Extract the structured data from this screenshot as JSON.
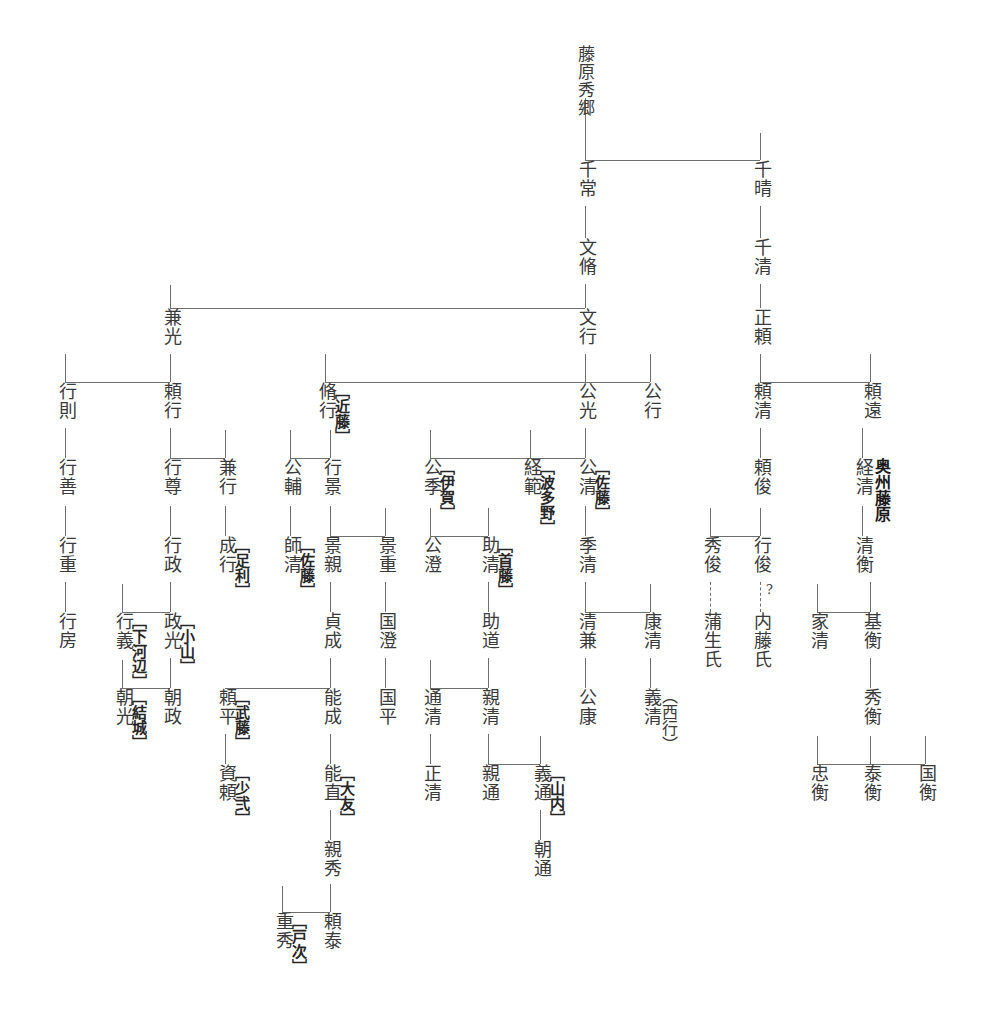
{
  "root": {
    "name": "藤原秀郷"
  },
  "persons": [
    {
      "id": "hidesato",
      "name": "藤原秀郷",
      "tag": "",
      "x": 585,
      "y": 45
    },
    {
      "id": "tsunetsune",
      "name": "千常",
      "tag": "",
      "x": 585,
      "y": 160
    },
    {
      "id": "fumiyoshi",
      "name": "文脩",
      "tag": "",
      "x": 585,
      "y": 238
    },
    {
      "id": "fumiyuki",
      "name": "文行",
      "tag": "",
      "x": 585,
      "y": 308
    },
    {
      "id": "chiharu",
      "name": "千晴",
      "tag": "",
      "x": 760,
      "y": 160
    },
    {
      "id": "chikiyo",
      "name": "千清",
      "tag": "",
      "x": 760,
      "y": 238
    },
    {
      "id": "masayori",
      "name": "正頼",
      "tag": "",
      "x": 760,
      "y": 308
    },
    {
      "id": "kanemitsu",
      "name": "兼光",
      "tag": "",
      "x": 170,
      "y": 308
    },
    {
      "id": "yukinori",
      "name": "行則",
      "tag": "",
      "x": 65,
      "y": 382
    },
    {
      "id": "yoriyuki",
      "name": "頼行",
      "tag": "",
      "x": 170,
      "y": 382
    },
    {
      "id": "nagayuki",
      "name": "脩行",
      "tag": "近藤",
      "x": 325,
      "y": 382
    },
    {
      "id": "kimimitsu",
      "name": "公光",
      "tag": "",
      "x": 585,
      "y": 382
    },
    {
      "id": "kimiyuki",
      "name": "公行",
      "tag": "",
      "x": 650,
      "y": 382
    },
    {
      "id": "yorikiyo",
      "name": "頼清",
      "tag": "",
      "x": 760,
      "y": 382
    },
    {
      "id": "yoritoh",
      "name": "頼遠",
      "tag": "",
      "x": 870,
      "y": 382
    },
    {
      "id": "yukiyoshi",
      "name": "行善",
      "tag": "",
      "x": 65,
      "y": 458
    },
    {
      "id": "yukitaka",
      "name": "行尊",
      "tag": "",
      "x": 170,
      "y": 458
    },
    {
      "id": "kaneyuki",
      "name": "兼行",
      "tag": "",
      "x": 225,
      "y": 458
    },
    {
      "id": "kinsuke",
      "name": "公輔",
      "tag": "",
      "x": 290,
      "y": 458
    },
    {
      "id": "yukikage",
      "name": "行景",
      "tag": "",
      "x": 330,
      "y": 458
    },
    {
      "id": "kimisue",
      "name": "公季",
      "tag": "伊賀",
      "x": 430,
      "y": 458
    },
    {
      "id": "tsunenori",
      "name": "経範",
      "tag": "波多野",
      "x": 530,
      "y": 458
    },
    {
      "id": "kimikiyo",
      "name": "公清",
      "tag": "佐藤",
      "x": 585,
      "y": 458
    },
    {
      "id": "yoritoshi",
      "name": "頼俊",
      "tag": "",
      "x": 760,
      "y": 458
    },
    {
      "id": "tsunekiyo",
      "name": "経清",
      "tag": "",
      "x": 862,
      "y": 458,
      "side_label": "奥州藤原"
    },
    {
      "id": "yukishige",
      "name": "行重",
      "tag": "",
      "x": 65,
      "y": 536
    },
    {
      "id": "yukimasa",
      "name": "行政",
      "tag": "",
      "x": 170,
      "y": 536
    },
    {
      "id": "nariyuki",
      "name": "成行",
      "tag": "足利",
      "x": 225,
      "y": 536
    },
    {
      "id": "morokiyo",
      "name": "師清",
      "tag": "佐藤",
      "x": 290,
      "y": 536
    },
    {
      "id": "kagechika",
      "name": "景親",
      "tag": "",
      "x": 330,
      "y": 536
    },
    {
      "id": "kageshige",
      "name": "景重",
      "tag": "",
      "x": 385,
      "y": 536
    },
    {
      "id": "kimizumi",
      "name": "公澄",
      "tag": "",
      "x": 430,
      "y": 536
    },
    {
      "id": "sukekiyo",
      "name": "助清",
      "tag": "首藤",
      "x": 488,
      "y": 536
    },
    {
      "id": "suekiyo",
      "name": "季清",
      "tag": "",
      "x": 585,
      "y": 536
    },
    {
      "id": "hidetoshi",
      "name": "秀俊",
      "tag": "",
      "x": 710,
      "y": 536
    },
    {
      "id": "yukitoshi",
      "name": "行俊",
      "tag": "",
      "x": 760,
      "y": 536
    },
    {
      "id": "kiyohira",
      "name": "清衡",
      "tag": "",
      "x": 862,
      "y": 536
    },
    {
      "id": "yukifusa",
      "name": "行房",
      "tag": "",
      "x": 65,
      "y": 612
    },
    {
      "id": "yukiyoshi2",
      "name": "行義",
      "tag": "下河辺",
      "x": 122,
      "y": 612
    },
    {
      "id": "masamitsu",
      "name": "政光",
      "tag": "小山",
      "x": 170,
      "y": 612
    },
    {
      "id": "sadanari",
      "name": "貞成",
      "tag": "",
      "x": 330,
      "y": 612
    },
    {
      "id": "kunizumi",
      "name": "国澄",
      "tag": "",
      "x": 385,
      "y": 612
    },
    {
      "id": "sukemichi",
      "name": "助道",
      "tag": "",
      "x": 488,
      "y": 612
    },
    {
      "id": "kiyokane",
      "name": "清兼",
      "tag": "",
      "x": 585,
      "y": 612
    },
    {
      "id": "yasukiyo",
      "name": "康清",
      "tag": "",
      "x": 650,
      "y": 612
    },
    {
      "id": "gamo",
      "name": "蒲生氏",
      "tag": "",
      "x": 710,
      "y": 612
    },
    {
      "id": "naito",
      "name": "内藤氏",
      "tag": "",
      "x": 760,
      "y": 612
    },
    {
      "id": "iekiyo",
      "name": "家清",
      "tag": "",
      "x": 817,
      "y": 612
    },
    {
      "id": "motohira",
      "name": "基衡",
      "tag": "",
      "x": 870,
      "y": 612
    },
    {
      "id": "tomomitsu",
      "name": "朝光",
      "tag": "結城",
      "x": 122,
      "y": 688
    },
    {
      "id": "tomomasa",
      "name": "朝政",
      "tag": "",
      "x": 170,
      "y": 688
    },
    {
      "id": "yorihira",
      "name": "頼平",
      "tag": "武藤",
      "x": 225,
      "y": 688
    },
    {
      "id": "yoshinari",
      "name": "能成",
      "tag": "",
      "x": 330,
      "y": 688
    },
    {
      "id": "kunihira",
      "name": "国平",
      "tag": "",
      "x": 385,
      "y": 688
    },
    {
      "id": "michikiyo",
      "name": "通清",
      "tag": "",
      "x": 430,
      "y": 688
    },
    {
      "id": "chikakiyo",
      "name": "親清",
      "tag": "",
      "x": 488,
      "y": 688
    },
    {
      "id": "kimiyasu",
      "name": "公康",
      "tag": "",
      "x": 585,
      "y": 688
    },
    {
      "id": "yoshikiyo",
      "name": "義清",
      "tag": "",
      "x": 650,
      "y": 688,
      "paren": "（西行）"
    },
    {
      "id": "hidehira",
      "name": "秀衡",
      "tag": "",
      "x": 870,
      "y": 688
    },
    {
      "id": "sukeyori",
      "name": "資頼",
      "tag": "少弐",
      "x": 225,
      "y": 764
    },
    {
      "id": "yoshinao",
      "name": "能直",
      "tag": "大友",
      "x": 330,
      "y": 764
    },
    {
      "id": "masakiyo",
      "name": "正清",
      "tag": "",
      "x": 430,
      "y": 764
    },
    {
      "id": "chikamichi",
      "name": "親通",
      "tag": "",
      "x": 488,
      "y": 764
    },
    {
      "id": "yoshimichi",
      "name": "義通",
      "tag": "山内",
      "x": 540,
      "y": 764
    },
    {
      "id": "tadahira",
      "name": "忠衡",
      "tag": "",
      "x": 817,
      "y": 764
    },
    {
      "id": "yasuhira",
      "name": "泰衡",
      "tag": "",
      "x": 870,
      "y": 764
    },
    {
      "id": "kunihira2",
      "name": "国衡",
      "tag": "",
      "x": 925,
      "y": 764
    },
    {
      "id": "chikahide",
      "name": "親秀",
      "tag": "",
      "x": 330,
      "y": 840
    },
    {
      "id": "tomomichi",
      "name": "朝通",
      "tag": "",
      "x": 540,
      "y": 840
    },
    {
      "id": "shigehide",
      "name": "重秀",
      "tag": "戸次",
      "x": 282,
      "y": 912
    },
    {
      "id": "yoriyasu",
      "name": "頼泰",
      "tag": "",
      "x": 330,
      "y": 912
    }
  ],
  "edges": {
    "vertical": [
      {
        "x": 585,
        "y": 98,
        "h": 62,
        "note": "hidesato-down"
      },
      {
        "x": 585,
        "y": 206,
        "h": 32,
        "note": "tsunetsune-fumiyoshi"
      },
      {
        "x": 585,
        "y": 284,
        "h": 24,
        "note": "fumiyoshi-fumiyuki"
      },
      {
        "x": 760,
        "y": 133,
        "h": 27,
        "note": "to-chiharu"
      },
      {
        "x": 760,
        "y": 206,
        "h": 32,
        "note": "chiharu-chikiyo"
      },
      {
        "x": 760,
        "y": 284,
        "h": 24,
        "note": "chikiyo-masayori"
      },
      {
        "x": 170,
        "y": 285,
        "h": 23,
        "note": "to-kanemitsu"
      },
      {
        "x": 170,
        "y": 354,
        "h": 28,
        "note": "kanemitsu-down"
      },
      {
        "x": 65,
        "y": 354,
        "h": 28,
        "note": "to-yukinori"
      },
      {
        "x": 325,
        "y": 354,
        "h": 28,
        "note": "to-nagayuki"
      },
      {
        "x": 585,
        "y": 354,
        "h": 28,
        "note": "to-kimimitsu"
      },
      {
        "x": 650,
        "y": 354,
        "h": 28,
        "note": "to-kimiyuki"
      },
      {
        "x": 760,
        "y": 354,
        "h": 28,
        "note": "to-yorikiyo"
      },
      {
        "x": 870,
        "y": 354,
        "h": 28,
        "note": "to-yoritoh"
      },
      {
        "x": 65,
        "y": 428,
        "h": 30,
        "note": "yukinori-yukiyoshi"
      },
      {
        "x": 170,
        "y": 428,
        "h": 30,
        "note": "yoriyuki-down"
      },
      {
        "x": 225,
        "y": 430,
        "h": 28,
        "note": "to-kaneyuki"
      },
      {
        "x": 290,
        "y": 430,
        "h": 28,
        "note": "to-kinsuke"
      },
      {
        "x": 330,
        "y": 430,
        "h": 28,
        "note": "to-yukikage"
      },
      {
        "x": 430,
        "y": 430,
        "h": 28,
        "note": "to-kimisue"
      },
      {
        "x": 530,
        "y": 430,
        "h": 28,
        "note": "to-tsunenori"
      },
      {
        "x": 585,
        "y": 428,
        "h": 30,
        "note": "kimimitsu-kimikiyo"
      },
      {
        "x": 760,
        "y": 428,
        "h": 30,
        "note": "yorikiyo-yoritoshi"
      },
      {
        "x": 862,
        "y": 428,
        "h": 30,
        "note": "yoritoh-tsunekiyo"
      },
      {
        "x": 65,
        "y": 506,
        "h": 30,
        "note": "yukiyoshi-yukishige"
      },
      {
        "x": 170,
        "y": 506,
        "h": 30,
        "note": "yukitaka-yukimasa"
      },
      {
        "x": 225,
        "y": 506,
        "h": 30,
        "note": "kaneyuki-nariyuki"
      },
      {
        "x": 290,
        "y": 506,
        "h": 30,
        "note": "kinsuke-morokiyo"
      },
      {
        "x": 330,
        "y": 506,
        "h": 30,
        "note": "yukikage-down"
      },
      {
        "x": 385,
        "y": 508,
        "h": 28,
        "note": "to-kageshige"
      },
      {
        "x": 430,
        "y": 508,
        "h": 28,
        "note": "to-kimizumi"
      },
      {
        "x": 488,
        "y": 508,
        "h": 28,
        "note": "to-sukekiyo"
      },
      {
        "x": 585,
        "y": 506,
        "h": 30,
        "note": "kimikiyo-suekiyo"
      },
      {
        "x": 862,
        "y": 506,
        "h": 30,
        "note": "tsunekiyo-kiyohira"
      },
      {
        "x": 710,
        "y": 508,
        "h": 28,
        "note": "to-hidetoshi"
      },
      {
        "x": 760,
        "y": 508,
        "h": 28,
        "note": "to-yukitoshi"
      },
      {
        "x": 65,
        "y": 582,
        "h": 30,
        "note": "yukishige-yukifusa"
      },
      {
        "x": 170,
        "y": 582,
        "h": 30,
        "note": "yukimasa-down"
      },
      {
        "x": 122,
        "y": 584,
        "h": 28,
        "note": "to-yukiyoshi2"
      },
      {
        "x": 330,
        "y": 582,
        "h": 30,
        "note": "kagechika-sadanari"
      },
      {
        "x": 385,
        "y": 582,
        "h": 30,
        "note": "kageshige-kunizumi"
      },
      {
        "x": 488,
        "y": 582,
        "h": 30,
        "note": "sukekiyo-sukemichi"
      },
      {
        "x": 585,
        "y": 582,
        "h": 30,
        "note": "suekiyo-down"
      },
      {
        "x": 650,
        "y": 584,
        "h": 28,
        "note": "to-yasukiyo"
      },
      {
        "x": 817,
        "y": 584,
        "h": 28,
        "note": "to-iekiyo"
      },
      {
        "x": 870,
        "y": 582,
        "h": 30,
        "note": "kiyohira-motohira"
      },
      {
        "x": 170,
        "y": 658,
        "h": 30,
        "note": "masamitsu-down"
      },
      {
        "x": 122,
        "y": 660,
        "h": 28,
        "note": "to-tomomitsu"
      },
      {
        "x": 330,
        "y": 658,
        "h": 30,
        "note": "sadanari-down"
      },
      {
        "x": 385,
        "y": 658,
        "h": 30,
        "note": "kunizumi-kunihira"
      },
      {
        "x": 430,
        "y": 660,
        "h": 28,
        "note": "to-michikiyo"
      },
      {
        "x": 488,
        "y": 658,
        "h": 30,
        "note": "sukemichi-chikakiyo"
      },
      {
        "x": 585,
        "y": 658,
        "h": 30,
        "note": "kiyokane-kimiyasu"
      },
      {
        "x": 650,
        "y": 658,
        "h": 30,
        "note": "yasukiyo-yoshikiyo"
      },
      {
        "x": 870,
        "y": 658,
        "h": 30,
        "note": "motohira-hidehira"
      },
      {
        "x": 225,
        "y": 734,
        "h": 30,
        "note": "yorihira-sukeyori"
      },
      {
        "x": 330,
        "y": 734,
        "h": 30,
        "note": "yoshinari-yoshinao"
      },
      {
        "x": 430,
        "y": 734,
        "h": 30,
        "note": "michikiyo-masakiyo"
      },
      {
        "x": 488,
        "y": 734,
        "h": 30,
        "note": "chikakiyo-down"
      },
      {
        "x": 540,
        "y": 736,
        "h": 28,
        "note": "to-yoshimichi"
      },
      {
        "x": 817,
        "y": 736,
        "h": 28,
        "note": "to-tadahira"
      },
      {
        "x": 870,
        "y": 736,
        "h": 28,
        "note": "to-yasuhira"
      },
      {
        "x": 925,
        "y": 736,
        "h": 28,
        "note": "to-kunihira2"
      },
      {
        "x": 330,
        "y": 810,
        "h": 30,
        "note": "yoshinao-chikahide"
      },
      {
        "x": 540,
        "y": 810,
        "h": 30,
        "note": "yoshimichi-tomomichi"
      },
      {
        "x": 330,
        "y": 884,
        "h": 28,
        "note": "chikahide-down"
      },
      {
        "x": 282,
        "y": 886,
        "h": 26,
        "note": "to-shigehide"
      }
    ],
    "horizontal": [
      {
        "x": 585,
        "y": 160,
        "w": 175,
        "note": "hidesato-children"
      },
      {
        "x": 170,
        "y": 308,
        "w": 415,
        "note": "fumiyoshi-children"
      },
      {
        "x": 65,
        "y": 382,
        "w": 105,
        "note": "kanemitsu-children"
      },
      {
        "x": 325,
        "y": 382,
        "w": 325,
        "note": "fumiyuki-children"
      },
      {
        "x": 760,
        "y": 382,
        "w": 110,
        "note": "masayori-children"
      },
      {
        "x": 170,
        "y": 458,
        "w": 55,
        "note": "yoriyuki-children"
      },
      {
        "x": 290,
        "y": 458,
        "w": 40,
        "note": "nagayuki-children"
      },
      {
        "x": 430,
        "y": 458,
        "w": 155,
        "note": "kimimitsu-children"
      },
      {
        "x": 330,
        "y": 536,
        "w": 55,
        "note": "yukikage-children"
      },
      {
        "x": 430,
        "y": 536,
        "w": 58,
        "note": "kimisue-children"
      },
      {
        "x": 710,
        "y": 536,
        "w": 50,
        "note": "yoritoshi-children"
      },
      {
        "x": 122,
        "y": 612,
        "w": 48,
        "note": "yukimasa-children"
      },
      {
        "x": 585,
        "y": 612,
        "w": 65,
        "note": "suekiyo-children"
      },
      {
        "x": 817,
        "y": 612,
        "w": 53,
        "note": "kiyohira-children"
      },
      {
        "x": 122,
        "y": 688,
        "w": 48,
        "note": "masamitsu-children"
      },
      {
        "x": 225,
        "y": 688,
        "w": 105,
        "note": "sadanari-children"
      },
      {
        "x": 430,
        "y": 688,
        "w": 58,
        "note": "sukemichi-children"
      },
      {
        "x": 488,
        "y": 764,
        "w": 52,
        "note": "chikakiyo-children"
      },
      {
        "x": 817,
        "y": 764,
        "w": 108,
        "note": "hidehira-children"
      },
      {
        "x": 282,
        "y": 912,
        "w": 48,
        "note": "chikahide-children"
      }
    ],
    "dashed_vertical": [
      {
        "x": 710,
        "y": 582,
        "h": 30,
        "note": "hidetoshi-gamo"
      },
      {
        "x": 760,
        "y": 582,
        "h": 30,
        "note": "yukitoshi-naito"
      }
    ]
  },
  "annotations": [
    {
      "id": "question-mark",
      "text": "?",
      "x": 766,
      "y": 582
    }
  ],
  "colors": {
    "line": "#6e6e6e",
    "text": "#3a3a3a",
    "tag": "#1a1a1a",
    "background": "#ffffff"
  }
}
